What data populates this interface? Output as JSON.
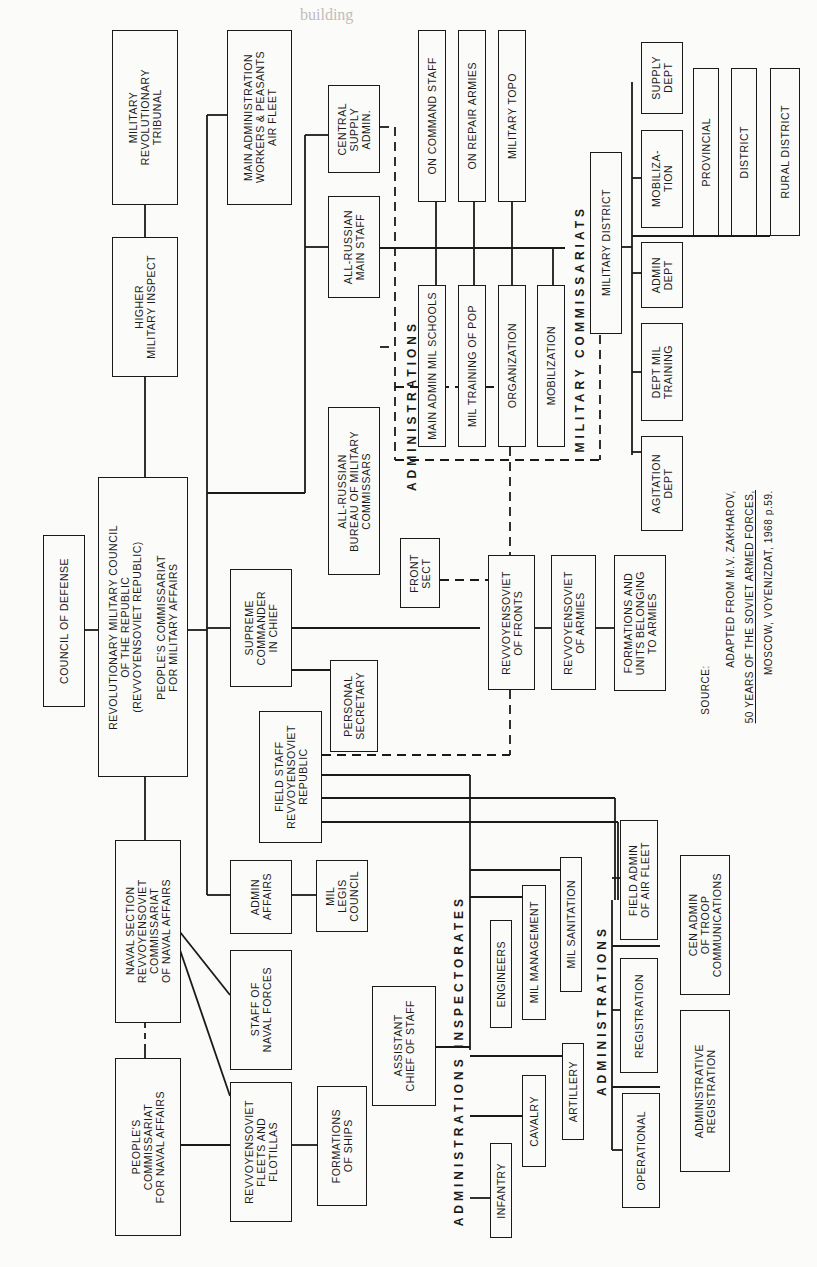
{
  "page": {
    "header_fragment": "building... (faint bleed-through page text)"
  },
  "chart": {
    "orientation": "rotated 90 degrees counter-clockwise",
    "top_level": {
      "council_of_defense": "COUNCIL OF DEFENSE",
      "rvsr": "REVOLUTIONARY MILITARY COUNCIL\nOF THE REPUBLIC\n(REVVOYENSOVIET REPUBLIC)\n\nPEOPLE'S COMMISSARIAT\nFOR MILITARY AFFAIRS",
      "tribunal": "MILITARY\nREVOLUTIONARY\nTRIBUNAL",
      "higher_inspect": "HIGHER\nMILITARY INSPECT",
      "naval_section": "NAVAL SECTION\nREVVOYENSOVIET\nCOMMISSARIAT\nOF NAVAL AFFAIRS",
      "naval_commissariat": "PEOPLE'S\nCOMMISSARIAT\nFOR NAVAL AFFAIRS"
    },
    "second_level": {
      "air_fleet": "MAIN ADMINISTRATION\nWORKERS & PEASANTS\nAIR FLEET",
      "central_supply": "CENTRAL\nSUPPLY\nADMIN.",
      "main_staff": "ALL-RUSSIAN\nMAIN STAFF",
      "bureau_commissars": "ALL-RUSSIAN\nBUREAU OF MILITARY\nCOMMISSARS",
      "supreme_commander": "SUPREME\nCOMMANDER\nIN CHIEF",
      "personal_secretary": "PERSONAL\nSECRETARY",
      "field_staff": "FIELD STAFF\nREVVOYENSOVIET\nREPUBLIC",
      "admin_affairs": "ADMIN\nAFFAIRS",
      "mil_legis": "MIL\nLEGIS\nCOUNCIL",
      "staff_naval": "STAFF OF\nNAVAL FORCES",
      "fleets": "REVVOYENSOVIET\nFLEETS AND\nFLOTILLAS",
      "formations_ships": "FORMATIONS\nOF SHIPS",
      "front_sect": "FRONT\nSECT",
      "fronts": "REVVOYENSOVIET\nOF FRONTS",
      "armies": "REVVOYENSOVIET\nOF ARMIES",
      "formations_units": "FORMATIONS AND\nUNITS BELONGING\nTO ARMIES",
      "asst_chief": "ASSISTANT\nCHIEF OF STAFF"
    },
    "administrations_top": {
      "heading": "ADMINISTRATIONS",
      "items": [
        "ON COMMAND STAFF",
        "ON REPAIR ARMIES",
        "MILITARY TOPO",
        "MAIN ADMIN MIL SCHOOLS",
        "MIL TRAINING OF POP",
        "ORGANIZATION",
        "MOBILIZATION"
      ]
    },
    "military_commissariats": {
      "heading": "MILITARY COMMISSARIATS",
      "district": "MILITARY DISTRICT",
      "depts": [
        "SUPPLY\nDEPT",
        "MOBILIZA-\nTION",
        "ADMIN\nDEPT",
        "DEPT MIL\nTRAINING",
        "AGITATION\nDEPT"
      ],
      "levels": [
        "PROVINCIAL",
        "DISTRICT",
        "RURAL DISTRICT"
      ]
    },
    "inspectorates": {
      "heading": "ADMINISTRATIONS  INSPECTORATES",
      "items": [
        "INFANTRY",
        "CAVALRY",
        "ARTILLERY",
        "ENGINEERS",
        "MIL MANAGEMENT",
        "MIL SANITATION"
      ]
    },
    "administrations_bottom": {
      "heading": "ADMINISTRATIONS",
      "items": [
        "OPERATIONAL",
        "REGISTRATION",
        "FIELD ADMIN\nOF AIR FLEET",
        "ADMINISTRATIVE\nREGISTRATION",
        "CEN ADMIN\nOF TROOP\nCOMMUNICATIONS"
      ]
    },
    "source": {
      "label": "SOURCE:",
      "line1": "ADAPTED FROM M.V. ZAKHAROV,",
      "line2": "50 YEARS OF THE SOVIET ARMED FORCES,",
      "line3": "MOSCOW, VOYENIZDAT, 1968 p.59."
    }
  }
}
